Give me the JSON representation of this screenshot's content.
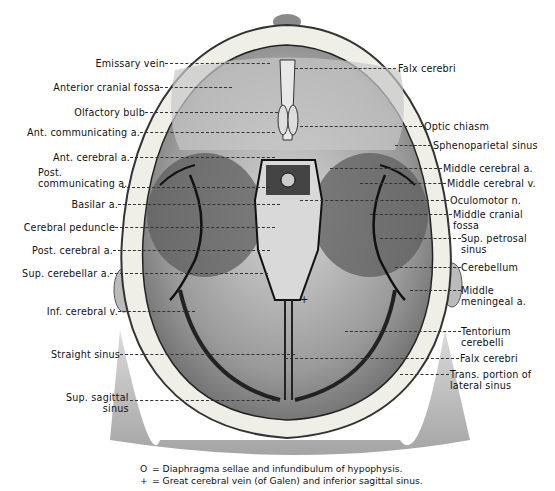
{
  "figure": {
    "left_labels": [
      {
        "id": "emissary-vein",
        "text": "Emissary vein",
        "x": 165,
        "y": 63,
        "line_to": 270
      },
      {
        "id": "anterior-cranial-fossa",
        "text": "Anterior cranial fossa",
        "x": 160,
        "y": 87,
        "line_to": 232
      },
      {
        "id": "olfactory-bulb",
        "text": "Olfactory bulb",
        "x": 145,
        "y": 112,
        "line_to": 278
      },
      {
        "id": "ant-communicating-a",
        "text": "Ant. communicating a.",
        "x": 140,
        "y": 132,
        "line_to": 275
      },
      {
        "id": "ant-cerebral-a",
        "text": "Ant. cerebral a.",
        "x": 130,
        "y": 157,
        "line_to": 275
      },
      {
        "id": "post-communicating-a",
        "text": "Post.\ncommunicating a.",
        "x": 122,
        "y": 176,
        "line_to": 270
      },
      {
        "id": "basilar-a",
        "text": "Basilar a.",
        "x": 118,
        "y": 204,
        "line_to": 280
      },
      {
        "id": "cerebral-peduncle",
        "text": "Cerebral peduncle",
        "x": 115,
        "y": 227,
        "line_to": 275
      },
      {
        "id": "post-cerebral-a",
        "text": "Post. cerebral a.",
        "x": 113,
        "y": 250,
        "line_to": 270
      },
      {
        "id": "sup-cerebellar-a",
        "text": "Sup. cerebellar a.",
        "x": 110,
        "y": 273,
        "line_to": 268
      },
      {
        "id": "inf-cerebral-v",
        "text": "Inf. cerebral v.",
        "x": 118,
        "y": 311,
        "line_to": 195
      },
      {
        "id": "straight-sinus",
        "text": "Straight sinus",
        "x": 120,
        "y": 354,
        "line_to": 295
      },
      {
        "id": "sup-sagittal-sinus",
        "text": "Sup. sagittal\nsinus",
        "x": 130,
        "y": 393,
        "line_to": 280
      }
    ],
    "right_labels": [
      {
        "id": "falx-cerebri-top",
        "text": "Falx cerebri",
        "x": 396,
        "y": 68,
        "line_from": 295
      },
      {
        "id": "optic-chiasm",
        "text": "Optic chiasm",
        "x": 422,
        "y": 121,
        "line_from": 300
      },
      {
        "id": "sphenoparietal-sinus",
        "text": "Sphenoparietal sinus",
        "x": 431,
        "y": 141,
        "line_from": 395
      },
      {
        "id": "middle-cerebral-a",
        "text": "Middle cerebral a.",
        "x": 442,
        "y": 164,
        "line_from": 330
      },
      {
        "id": "middle-cerebral-v",
        "text": "Middle cerebral v.",
        "x": 446,
        "y": 180,
        "line_from": 360
      },
      {
        "id": "oculomotor-n",
        "text": "Oculomotor n.",
        "x": 449,
        "y": 197,
        "line_from": 300
      },
      {
        "id": "middle-cranial-fossa",
        "text": "Middle cranial\nfossa",
        "x": 452,
        "y": 210,
        "line_from": 370
      },
      {
        "id": "sup-petrosal-sinus",
        "text": "Sup. petrosal\nsinus",
        "x": 461,
        "y": 234,
        "line_from": 380
      },
      {
        "id": "cerebellum",
        "text": "Cerebellum",
        "x": 461,
        "y": 263,
        "line_from": 395
      },
      {
        "id": "middle-meningeal-a",
        "text": "Middle\nmeningeal a.",
        "x": 461,
        "y": 286,
        "line_from": 410
      },
      {
        "id": "tentorium-cerebelli",
        "text": "Tentorium\ncerebelli",
        "x": 461,
        "y": 328,
        "line_from": 345
      },
      {
        "id": "falx-cerebri-bottom",
        "text": "Falx cerebri",
        "x": 459,
        "y": 354,
        "line_from": 285
      },
      {
        "id": "trans-portion-lateral-sinus",
        "text": "Trans. portion of\nlateral sinus",
        "x": 449,
        "y": 370,
        "line_from": 400
      }
    ],
    "legend": [
      {
        "symbol": "O",
        "text": "= Diaphragma sellae and infundibulum of hypophysis."
      },
      {
        "symbol": "+",
        "text": "= Great cerebral vein (of Galen) and inferior sagittal sinus."
      }
    ]
  }
}
